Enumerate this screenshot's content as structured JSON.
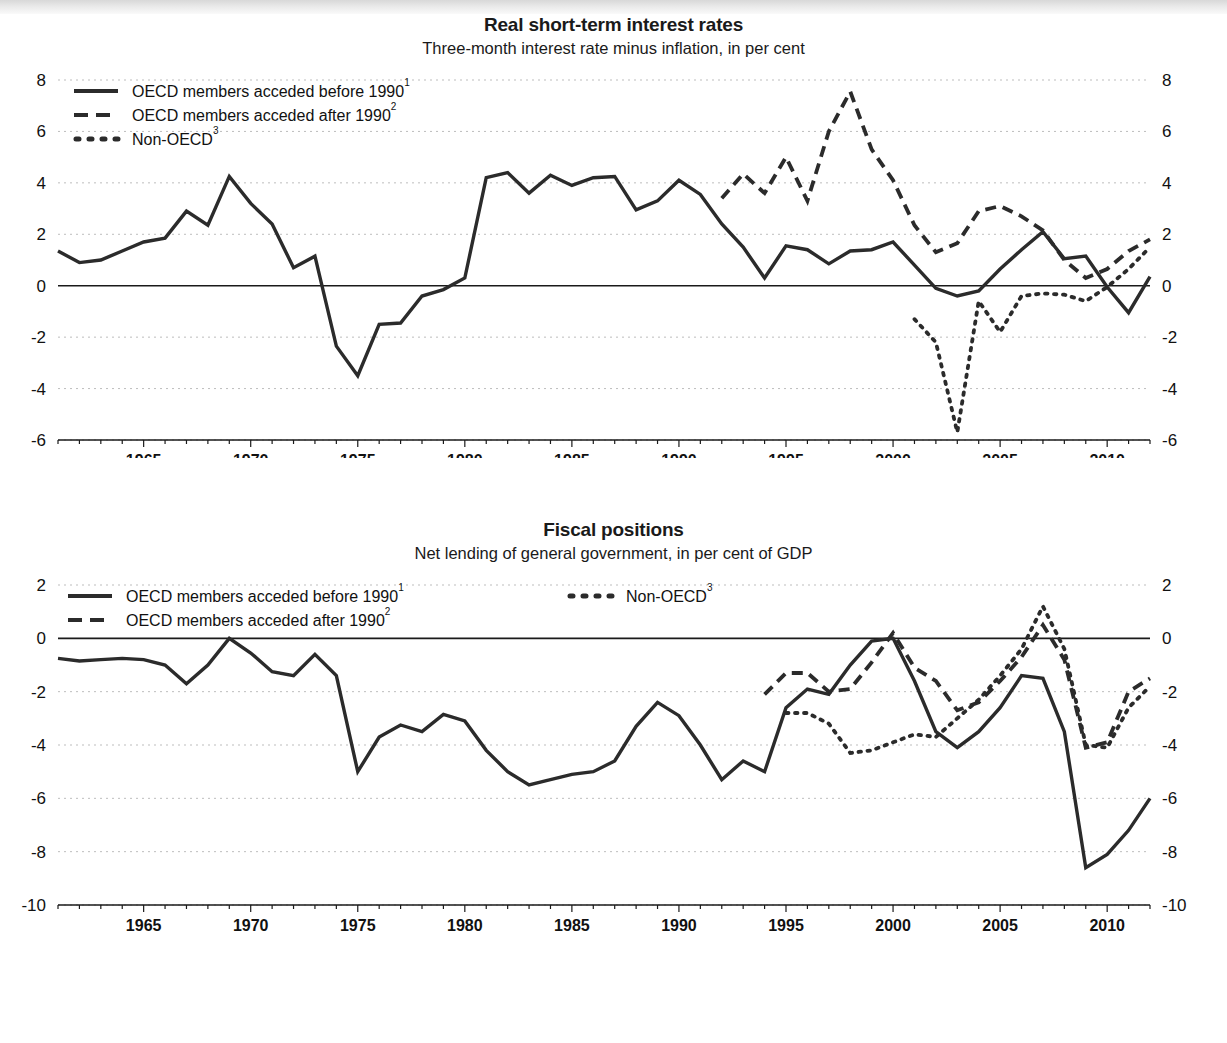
{
  "page": {
    "background_color": "#ffffff",
    "ink_color": "#2b2b2b",
    "grid_color": "#bdbdbd"
  },
  "charts": [
    {
      "id": "real-short-term-interest-rates",
      "title": "Real short-term interest rates",
      "subtitle": "Three-month interest rate minus inflation, in per cent",
      "legend": [
        {
          "style": "solid",
          "label": "OECD members acceded before 1990",
          "sup": "1"
        },
        {
          "style": "dashed",
          "label": "OECD members acceded after 1990",
          "sup": "2"
        },
        {
          "style": "dotted",
          "label": "Non-OECD",
          "sup": "3"
        }
      ],
      "legend_layout": "single-column"
    },
    {
      "id": "fiscal-positions",
      "title": "Fiscal positions",
      "subtitle": "Net lending of general government, in per cent of GDP",
      "legend": [
        {
          "style": "solid",
          "label": "OECD members acceded before 1990",
          "sup": "1"
        },
        {
          "style": "dashed",
          "label": "OECD members acceded after 1990",
          "sup": "2"
        },
        {
          "style": "dotted",
          "label": "Non-OECD",
          "sup": "3"
        }
      ],
      "legend_layout": "two-column"
    }
  ],
  "chart_data": [
    {
      "type": "line",
      "title": "Real short-term interest rates",
      "subtitle": "Three-month interest rate minus inflation, in per cent",
      "xlabel": "",
      "ylabel": "per cent",
      "xlim": [
        1961,
        2012
      ],
      "ylim": [
        -6,
        8
      ],
      "yticks": [
        -6,
        -4,
        -2,
        0,
        2,
        4,
        6,
        8
      ],
      "xticks": [
        1965,
        1970,
        1975,
        1980,
        1985,
        1990,
        1995,
        2000,
        2005,
        2010
      ],
      "xtick_minor_step": 1,
      "grid": true,
      "grid_axis": "y",
      "zero_line": true,
      "legend_position": "top-left",
      "dual_y_axis": true,
      "series": [
        {
          "name": "OECD members acceded before 1990",
          "sup": "1",
          "style": "solid",
          "x": [
            1961,
            1962,
            1963,
            1964,
            1965,
            1966,
            1967,
            1968,
            1969,
            1970,
            1971,
            1972,
            1973,
            1974,
            1975,
            1976,
            1977,
            1978,
            1979,
            1980,
            1981,
            1982,
            1983,
            1984,
            1985,
            1986,
            1987,
            1988,
            1989,
            1990,
            1991,
            1992,
            1993,
            1994,
            1995,
            1996,
            1997,
            1998,
            1999,
            2000,
            2001,
            2002,
            2003,
            2004,
            2005,
            2006,
            2007,
            2008,
            2009,
            2010,
            2011,
            2012
          ],
          "values": [
            1.35,
            0.9,
            1.0,
            1.35,
            1.7,
            1.85,
            2.9,
            2.35,
            4.25,
            3.2,
            2.4,
            0.7,
            1.15,
            -2.35,
            -3.5,
            -1.5,
            -1.45,
            -0.4,
            -0.15,
            0.3,
            4.2,
            4.4,
            3.6,
            4.3,
            3.9,
            4.2,
            4.25,
            2.95,
            3.3,
            4.1,
            3.55,
            2.4,
            1.5,
            0.3,
            1.55,
            1.4,
            0.85,
            1.35,
            1.4,
            1.7,
            0.8,
            -0.1,
            -0.4,
            -0.2,
            0.65,
            1.4,
            2.1,
            1.05,
            1.15,
            -0.05,
            -1.05,
            0.35
          ]
        },
        {
          "name": "OECD members acceded after 1990",
          "sup": "2",
          "style": "dashed",
          "x": [
            1992,
            1993,
            1994,
            1995,
            1996,
            1997,
            1998,
            1999,
            2000,
            2001,
            2002,
            2003,
            2004,
            2005,
            2006,
            2007,
            2008,
            2009,
            2010,
            2011,
            2012
          ],
          "values": [
            3.4,
            4.35,
            3.6,
            5.0,
            3.3,
            6.0,
            7.55,
            5.3,
            4.1,
            2.35,
            1.3,
            1.65,
            2.9,
            3.1,
            2.7,
            2.15,
            1.0,
            0.3,
            0.65,
            1.35,
            1.8
          ]
        },
        {
          "name": "Non-OECD",
          "sup": "3",
          "style": "dotted",
          "x": [
            2001,
            2002,
            2003,
            2004,
            2005,
            2006,
            2007,
            2008,
            2009,
            2010,
            2011,
            2012
          ],
          "values": [
            -1.3,
            -2.2,
            -5.7,
            -0.6,
            -1.8,
            -0.4,
            -0.3,
            -0.35,
            -0.6,
            -0.05,
            0.65,
            1.5
          ]
        }
      ]
    },
    {
      "type": "line",
      "title": "Fiscal positions",
      "subtitle": "Net lending of general government, in per cent of GDP",
      "xlabel": "",
      "ylabel": "per cent of GDP",
      "xlim": [
        1961,
        2012
      ],
      "ylim": [
        -10,
        2
      ],
      "yticks": [
        -10,
        -8,
        -6,
        -4,
        -2,
        0,
        2
      ],
      "xticks": [
        1965,
        1970,
        1975,
        1980,
        1985,
        1990,
        1995,
        2000,
        2005,
        2010
      ],
      "xtick_minor_step": 1,
      "grid": true,
      "grid_axis": "y",
      "zero_line": true,
      "legend_position": "top-left",
      "dual_y_axis": true,
      "series": [
        {
          "name": "OECD members acceded before 1990",
          "sup": "1",
          "style": "solid",
          "x": [
            1961,
            1962,
            1963,
            1964,
            1965,
            1966,
            1967,
            1968,
            1969,
            1970,
            1971,
            1972,
            1973,
            1974,
            1975,
            1976,
            1977,
            1978,
            1979,
            1980,
            1981,
            1982,
            1983,
            1984,
            1985,
            1986,
            1987,
            1988,
            1989,
            1990,
            1991,
            1992,
            1993,
            1994,
            1995,
            1996,
            1997,
            1998,
            1999,
            2000,
            2001,
            2002,
            2003,
            2004,
            2005,
            2006,
            2007,
            2008,
            2009,
            2010,
            2011,
            2012
          ],
          "values": [
            -0.75,
            -0.85,
            -0.8,
            -0.75,
            -0.8,
            -1.0,
            -1.7,
            -1.0,
            0.0,
            -0.55,
            -1.25,
            -1.4,
            -0.6,
            -1.4,
            -5.0,
            -3.7,
            -3.25,
            -3.5,
            -2.85,
            -3.1,
            -4.2,
            -5.0,
            -5.5,
            -5.3,
            -5.1,
            -5.0,
            -4.6,
            -3.3,
            -2.4,
            -2.9,
            -4.0,
            -5.3,
            -4.6,
            -5.0,
            -2.6,
            -1.9,
            -2.1,
            -1.0,
            -0.1,
            0.0,
            -1.6,
            -3.5,
            -4.1,
            -3.5,
            -2.6,
            -1.4,
            -1.5,
            -3.5,
            -8.6,
            -8.1,
            -7.2,
            -6.0
          ]
        },
        {
          "name": "OECD members acceded after 1990",
          "sup": "2",
          "style": "dashed",
          "x": [
            1994,
            1995,
            1996,
            1997,
            1998,
            1999,
            2000,
            2001,
            2002,
            2003,
            2004,
            2005,
            2006,
            2007,
            2008,
            2009,
            2010,
            2011,
            2012
          ],
          "values": [
            -2.1,
            -1.3,
            -1.3,
            -2.0,
            -1.9,
            -0.9,
            0.2,
            -1.1,
            -1.6,
            -2.7,
            -2.4,
            -1.6,
            -0.7,
            0.5,
            -0.8,
            -4.1,
            -3.9,
            -2.0,
            -1.5
          ]
        },
        {
          "name": "Non-OECD",
          "sup": "3",
          "style": "dotted",
          "x": [
            1995,
            1996,
            1997,
            1998,
            1999,
            2000,
            2001,
            2002,
            2003,
            2004,
            2005,
            2006,
            2007,
            2008,
            2009,
            2010,
            2011,
            2012
          ],
          "values": [
            -2.8,
            -2.8,
            -3.2,
            -4.3,
            -4.2,
            -3.9,
            -3.6,
            -3.7,
            -3.0,
            -2.3,
            -1.4,
            -0.4,
            1.2,
            -0.4,
            -4.0,
            -4.1,
            -2.6,
            -1.8
          ]
        }
      ]
    }
  ]
}
